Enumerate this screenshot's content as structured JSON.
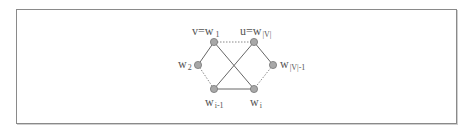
{
  "diagram": {
    "colors": {
      "edge": "#666666",
      "dotted_edge": "#888888",
      "node_fill": "#a8a8a8",
      "node_stroke": "#777777",
      "frame": "#8a8a8a",
      "text": "#555555"
    },
    "nodes": [
      {
        "id": "w1",
        "label_main": "v=w",
        "label_sub": "1",
        "x": 214,
        "y": 42
      },
      {
        "id": "wV",
        "label_main": "u=w",
        "label_sub": "|V|",
        "x": 254,
        "y": 42
      },
      {
        "id": "w2",
        "label_main": "w",
        "label_sub": "2",
        "x": 198,
        "y": 65
      },
      {
        "id": "wV1",
        "label_main": "w",
        "label_sub": "|V|-1",
        "x": 273,
        "y": 65
      },
      {
        "id": "wi1",
        "label_main": "w",
        "label_sub": "i-1",
        "x": 214,
        "y": 89
      },
      {
        "id": "wi",
        "label_main": "w",
        "label_sub": "i",
        "x": 254,
        "y": 89
      }
    ],
    "edges": [
      {
        "from": "w1",
        "to": "wV",
        "style": "dotted"
      },
      {
        "from": "w1",
        "to": "w2",
        "style": "solid"
      },
      {
        "from": "w1",
        "to": "wi",
        "style": "solid"
      },
      {
        "from": "wV",
        "to": "wi1",
        "style": "solid"
      },
      {
        "from": "wV",
        "to": "wV1",
        "style": "solid"
      },
      {
        "from": "w2",
        "to": "wi1",
        "style": "dotted"
      },
      {
        "from": "wV1",
        "to": "wi",
        "style": "dotted"
      },
      {
        "from": "wi1",
        "to": "wi",
        "style": "solid"
      }
    ]
  }
}
